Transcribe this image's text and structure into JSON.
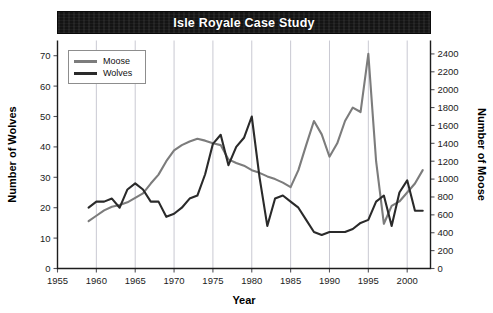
{
  "chart_data": {
    "type": "line",
    "title": "Isle Royale Case Study",
    "xlabel": "Year",
    "ylabel": "Number of Wolves",
    "y2label": "Number of Moose",
    "xlim": [
      1955,
      2003
    ],
    "ylim": [
      0,
      75
    ],
    "y2lim": [
      0,
      2550
    ],
    "xticks": [
      1955,
      1960,
      1965,
      1970,
      1975,
      1980,
      1985,
      1990,
      1995,
      2000
    ],
    "yticks": [
      0,
      10,
      20,
      30,
      40,
      50,
      60,
      70
    ],
    "y2ticks": [
      0,
      200,
      400,
      600,
      800,
      1000,
      1200,
      1400,
      1600,
      1800,
      2000,
      2200,
      2400
    ],
    "grid": "vertical",
    "legend_position": "top-left",
    "colors": {
      "moose": "#7c7c7c",
      "wolves": "#2a2a2a",
      "title_band": "#141414",
      "title_text": "#ffffff",
      "gridline": "#c9c9d2",
      "axis": "#1d1d1d"
    },
    "series": [
      {
        "name": "Moose",
        "axis": "right",
        "unit": "Number of Moose",
        "x": [
          1959,
          1960,
          1961,
          1962,
          1963,
          1964,
          1965,
          1966,
          1967,
          1968,
          1969,
          1970,
          1971,
          1972,
          1973,
          1974,
          1975,
          1976,
          1977,
          1978,
          1979,
          1980,
          1981,
          1982,
          1983,
          1984,
          1985,
          1986,
          1987,
          1988,
          1989,
          1990,
          1991,
          1992,
          1993,
          1994,
          1995,
          1996,
          1997,
          1998,
          1999,
          2000,
          2001,
          2002
        ],
        "values": [
          530,
          590,
          650,
          690,
          710,
          740,
          790,
          840,
          950,
          1050,
          1200,
          1320,
          1380,
          1420,
          1450,
          1430,
          1400,
          1380,
          1220,
          1180,
          1150,
          1100,
          1070,
          1030,
          1000,
          960,
          910,
          1100,
          1380,
          1650,
          1500,
          1250,
          1400,
          1650,
          1800,
          1750,
          2400,
          1200,
          500,
          700,
          750,
          850,
          950,
          1100
        ]
      },
      {
        "name": "Wolves",
        "axis": "left",
        "unit": "Number of Wolves",
        "x": [
          1959,
          1960,
          1961,
          1962,
          1963,
          1964,
          1965,
          1966,
          1967,
          1968,
          1969,
          1970,
          1971,
          1972,
          1973,
          1974,
          1975,
          1976,
          1977,
          1978,
          1979,
          1980,
          1981,
          1982,
          1983,
          1984,
          1985,
          1986,
          1987,
          1988,
          1989,
          1990,
          1991,
          1992,
          1993,
          1994,
          1995,
          1996,
          1997,
          1998,
          1999,
          2000,
          2001,
          2002
        ],
        "values": [
          20,
          22,
          22,
          23,
          20,
          26,
          28,
          26,
          22,
          22,
          17,
          18,
          20,
          23,
          24,
          31,
          41,
          44,
          34,
          40,
          43,
          50,
          30,
          14,
          23,
          24,
          22,
          20,
          16,
          12,
          11,
          12,
          12,
          12,
          13,
          15,
          16,
          22,
          24,
          14,
          25,
          29,
          19,
          19
        ]
      }
    ],
    "annotations": {
      "moose_peak": {
        "year": 1995,
        "value": 2400
      },
      "wolves_peak": {
        "year": 1980,
        "value": 50
      },
      "moose_crash": {
        "year": 1997,
        "value": 500
      }
    }
  },
  "legend": {
    "items": [
      {
        "label": "Moose",
        "color": "#7c7c7c"
      },
      {
        "label": "Wolves",
        "color": "#2a2a2a"
      }
    ]
  }
}
